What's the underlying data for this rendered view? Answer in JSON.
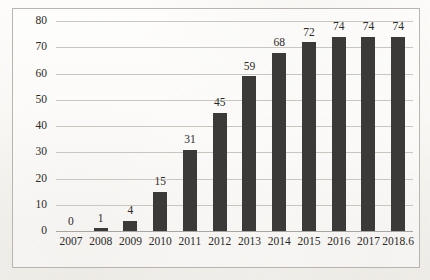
{
  "chart_data": {
    "type": "bar",
    "title": "",
    "subtitle": "",
    "xlabel": "",
    "ylabel": "",
    "categories": [
      "2007",
      "2008",
      "2009",
      "2010",
      "2011",
      "2012",
      "2013",
      "2014",
      "2015",
      "2016",
      "2017",
      "2018.6"
    ],
    "values": [
      0,
      1,
      4,
      15,
      31,
      45,
      59,
      68,
      72,
      74,
      74,
      74
    ],
    "data_labels": [
      "0",
      "1",
      "4",
      "15",
      "31",
      "45",
      "59",
      "68",
      "72",
      "74",
      "74",
      "74"
    ],
    "ylim": [
      0,
      80
    ],
    "ytick_values": [
      0,
      10,
      20,
      30,
      40,
      50,
      60,
      70,
      80
    ],
    "ytick_labels": [
      "0",
      "10",
      "20",
      "30",
      "40",
      "50",
      "60",
      "70",
      "80"
    ],
    "grid": true,
    "grid_axis": "y",
    "legend": false,
    "legend_position": "none",
    "series": [
      {
        "name": "",
        "values": [
          0,
          1,
          4,
          15,
          31,
          45,
          59,
          68,
          72,
          74,
          74,
          74
        ],
        "color": "#3b3a38"
      }
    ],
    "colors": {
      "bar": "#3b3a38",
      "gridline": "#c9c6c0",
      "axis": "#a9a6a0",
      "frame_border": "#b9b5ae",
      "text": "#2c2a28",
      "background": "#fbfaf8"
    }
  }
}
